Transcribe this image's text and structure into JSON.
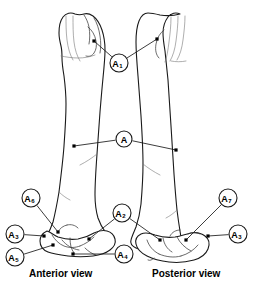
{
  "figure": {
    "background_color": "#ffffff",
    "line_color": "#1a1a1a",
    "width": 255,
    "height": 297
  },
  "captions": {
    "anterior": "Anterior view",
    "posterior": "Posterior view"
  },
  "callouts": [
    {
      "id": "A1",
      "letter": "A",
      "subscript": "1",
      "cx": 119,
      "cy": 63,
      "r": 9,
      "targets": [
        {
          "x": 94,
          "y": 41
        },
        {
          "x": 157,
          "y": 39
        }
      ]
    },
    {
      "id": "A",
      "letter": "A",
      "subscript": "",
      "cx": 124,
      "cy": 139,
      "r": 8,
      "targets": [
        {
          "x": 74,
          "y": 146
        },
        {
          "x": 176,
          "y": 150
        }
      ]
    },
    {
      "id": "A2",
      "letter": "A",
      "subscript": "2",
      "cx": 122,
      "cy": 213,
      "r": 9,
      "targets": [
        {
          "x": 89,
          "y": 239
        },
        {
          "x": 160,
          "y": 240
        }
      ]
    },
    {
      "id": "A3-left",
      "letter": "A",
      "subscript": "3",
      "cx": 15,
      "cy": 234,
      "r": 9,
      "targets": [
        {
          "x": 44,
          "y": 236
        }
      ]
    },
    {
      "id": "A4",
      "letter": "A",
      "subscript": "4",
      "cx": 124,
      "cy": 254,
      "r": 9,
      "targets": [
        {
          "x": 73,
          "y": 254
        }
      ]
    },
    {
      "id": "A5",
      "letter": "A",
      "subscript": "5",
      "cx": 15,
      "cy": 257,
      "r": 9,
      "targets": [
        {
          "x": 53,
          "y": 245
        }
      ]
    },
    {
      "id": "A6",
      "letter": "A",
      "subscript": "6",
      "cx": 31,
      "cy": 198,
      "r": 9,
      "targets": [
        {
          "x": 58,
          "y": 232
        }
      ]
    },
    {
      "id": "A7",
      "letter": "A",
      "subscript": "7",
      "cx": 228,
      "cy": 198,
      "r": 9,
      "targets": [
        {
          "x": 186,
          "y": 240
        }
      ]
    },
    {
      "id": "A3-right",
      "letter": "A",
      "subscript": "3",
      "cx": 238,
      "cy": 234,
      "r": 9,
      "targets": [
        {
          "x": 208,
          "y": 236
        }
      ]
    }
  ],
  "bones": {
    "anterior": {
      "name": "humerus-anterior",
      "outline": "M 75,14 C 71,12 66,13 63,17 C 60,21 59,27 59,33 C 59,38 60,42 61,46 C 62,50 62,54 62,58 C 62,64 63,70 64,76 C 65,84 66,94 66,104 C 66,118 65,132 64,146 C 63,160 61,176 59,192 C 57,204 55,214 53,222 C 51,228 49,232 47,235 C 45,238 45,241 47,243 C 49,246 53,248 58,249 C 64,250 72,251 80,251 C 88,251 95,250 100,248 C 104,247 107,245 108,242 C 109,239 108,236 106,233 C 103,229 100,224 98,218 C 96,211 95,203 95,195 C 95,182 96,168 97,154 C 98,140 99,126 100,112 C 101,100 102,88 103,78 C 104,68 105,58 105,50 C 105,43 104,36 102,30 C 100,24 97,19 93,16 C 90,14 87,13 84,14 C 81,15 78,15 75,14 Z",
      "details": [
        "M 66,16 C 66,24 66,32 67,40 C 68,48 70,55 73,60",
        "M 73,16 C 73,25 73,34 74,42 C 75,50 77,56 80,61",
        "M 84,15 C 86,18 88,22 89,27 C 90,33 90,39 89,44",
        "M 94,18 C 97,23 99,29 100,36 C 101,42 101,48 100,53",
        "M 88,27 C 92,30 95,35 96,41 C 97,46 96,50 94,53 C 92,56 89,57 86,56",
        "M 61,56 C 66,57 72,58 78,58 C 84,58 90,57 95,55",
        "M 97,154 C 92,158 86,162 80,165",
        "M 59,192 C 62,195 66,198 70,200"
      ],
      "shades": [
        "M 86,20 C 93,22 98,29 99,37 C 100,44 98,50 94,54 C 91,57 87,57 84,55 C 88,52 91,47 91,41 C 91,32 89,25 86,20 Z"
      ],
      "distal": {
        "outline": "M 47,231 C 43,233 40,237 40,241 C 40,246 43,250 48,252 C 53,254 60,255 68,256 C 76,257 85,257 93,256 C 100,255 106,253 110,250 C 114,247 116,243 115,239 C 114,235 111,232 107,231 C 103,230 98,231 94,233 C 89,236 84,238 78,239 C 71,240 64,239 58,237 C 54,235 50,232 47,231 Z",
        "details": [
          "M 52,235 C 55,240 59,244 64,246 C 69,248 75,248 80,246",
          "M 80,246 C 85,244 90,241 94,237",
          "M 62,240 C 66,245 72,249 79,250",
          "M 85,248 C 88,251 92,254 96,255",
          "M 70,238 C 70,244 71,249 74,253",
          "M 58,232 C 60,228 63,226 67,225",
          "M 67,225 C 71,224 75,225 78,228"
        ]
      }
    },
    "posterior": {
      "name": "humerus-posterior",
      "outline": "M 180,14 C 176,12 171,13 168,17 C 165,21 163,27 163,33 C 163,39 164,45 165,51 C 166,60 167,70 168,80 C 169,94 170,110 171,126 C 172,142 173,158 174,174 C 175,188 176,200 177,210 C 178,218 179,225 180,231 C 181,236 181,240 180,243 C 179,246 176,248 172,249 C 167,250 160,251 153,251 C 146,251 140,250 136,248 C 132,246 130,243 131,240 C 132,236 134,232 136,227 C 138,221 140,213 141,204 C 142,192 143,178 143,164 C 143,148 142,132 141,116 C 140,102 139,88 138,76 C 137,64 136,52 136,42 C 136,34 137,26 139,21 C 141,16 144,13 148,13 C 152,13 156,14 160,15 C 166,16 173,16 180,14 Z",
      "details": [
        "M 185,16 C 185,24 184,32 183,40 C 182,48 180,55 177,60",
        "M 178,16 C 178,25 177,33 176,41 C 175,49 173,56 170,61",
        "M 171,17 C 171,26 170,34 169,42 C 168,50 167,57 165,62",
        "M 164,30 C 160,33 157,38 156,44 C 155,50 156,55 159,58",
        "M 171,61 C 176,62 181,62 186,61",
        "M 143,164 C 148,168 154,172 160,175",
        "M 177,210 C 174,213 170,216 166,218"
      ],
      "shades": [
        "M 158,22 C 151,25 147,32 147,40 C 147,47 150,53 155,56 C 151,49 150,41 152,33 C 153,29 155,25 158,22 Z"
      ],
      "distal": {
        "outline": "M 141,234 C 137,236 135,240 136,244 C 137,249 141,253 147,256 C 153,259 161,261 169,262 C 178,263 187,262 194,260 C 201,258 206,254 208,249 C 210,244 209,239 205,236 C 201,233 196,232 191,233 C 186,234 181,236 175,237 C 168,238 161,237 155,235 C 150,233 145,232 141,234 Z",
        "details": [
          "M 147,240 C 149,246 153,251 159,254",
          "M 159,254 C 166,257 174,258 181,256",
          "M 181,256 C 188,254 194,250 198,245",
          "M 163,238 C 164,244 167,249 172,252",
          "M 177,237 C 180,243 185,248 191,251",
          "M 154,258 C 152,260 150,261 148,260",
          "M 170,236 C 172,232 176,230 180,230",
          "M 188,234 C 192,232 196,232 200,234"
        ]
      }
    }
  }
}
